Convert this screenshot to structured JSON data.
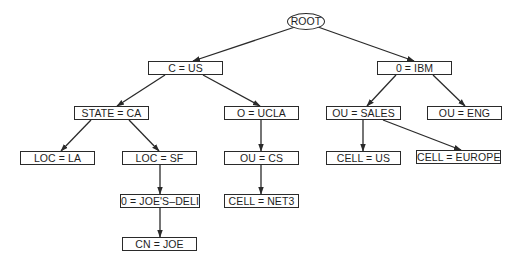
{
  "diagram": {
    "type": "directory-information-tree",
    "colors": {
      "line": "#2a2a2a",
      "text": "#1e1e1e",
      "background": "#ffffff"
    },
    "nodes": [
      {
        "id": "root",
        "label": "ROOT",
        "shape": "ellipse",
        "x": 287,
        "y": 13,
        "w": 38,
        "h": 17
      },
      {
        "id": "c_us",
        "label": "C = US",
        "shape": "rect",
        "x": 148,
        "y": 61,
        "w": 75,
        "h": 14
      },
      {
        "id": "o_ibm",
        "label": "0 = IBM",
        "shape": "rect",
        "x": 377,
        "y": 61,
        "w": 75,
        "h": 14
      },
      {
        "id": "state_ca",
        "label": "STATE = CA",
        "shape": "rect",
        "x": 74,
        "y": 106,
        "w": 75,
        "h": 14
      },
      {
        "id": "o_ucla",
        "label": "O = UCLA",
        "shape": "rect",
        "x": 224,
        "y": 106,
        "w": 75,
        "h": 14
      },
      {
        "id": "ou_sales",
        "label": "OU = SALES",
        "shape": "rect",
        "x": 326,
        "y": 106,
        "w": 75,
        "h": 14
      },
      {
        "id": "ou_eng",
        "label": "OU = ENG",
        "shape": "rect",
        "x": 427,
        "y": 106,
        "w": 75,
        "h": 14
      },
      {
        "id": "loc_la",
        "label": "LOC = LA",
        "shape": "rect",
        "x": 20,
        "y": 151,
        "w": 75,
        "h": 14
      },
      {
        "id": "loc_sf",
        "label": "LOC = SF",
        "shape": "rect",
        "x": 122,
        "y": 151,
        "w": 75,
        "h": 14
      },
      {
        "id": "ou_cs",
        "label": "OU = CS",
        "shape": "rect",
        "x": 224,
        "y": 151,
        "w": 75,
        "h": 14
      },
      {
        "id": "cell_us",
        "label": "CELL = US",
        "shape": "rect",
        "x": 326,
        "y": 151,
        "w": 75,
        "h": 14
      },
      {
        "id": "cell_eu",
        "label": "CELL = EUROPE",
        "shape": "rect",
        "x": 416,
        "y": 150,
        "w": 85,
        "h": 14
      },
      {
        "id": "o_joes",
        "label": "0 = JOE'S–DELI",
        "shape": "rect",
        "x": 120,
        "y": 194,
        "w": 80,
        "h": 14
      },
      {
        "id": "cell_net3",
        "label": "CELL = NET3",
        "shape": "rect",
        "x": 224,
        "y": 194,
        "w": 75,
        "h": 14
      },
      {
        "id": "cn_joe",
        "label": "CN = JOE",
        "shape": "rect",
        "x": 122,
        "y": 237,
        "w": 75,
        "h": 14
      }
    ],
    "edges": [
      {
        "from": "root",
        "to": "c_us",
        "x1": 295,
        "y1": 27,
        "x2": 193,
        "y2": 61
      },
      {
        "from": "root",
        "to": "o_ibm",
        "x1": 318,
        "y1": 27,
        "x2": 414,
        "y2": 61
      },
      {
        "from": "c_us",
        "to": "state_ca",
        "x1": 165,
        "y1": 75,
        "x2": 117,
        "y2": 106
      },
      {
        "from": "c_us",
        "to": "o_ucla",
        "x1": 203,
        "y1": 75,
        "x2": 260,
        "y2": 106
      },
      {
        "from": "o_ibm",
        "to": "ou_sales",
        "x1": 396,
        "y1": 75,
        "x2": 367,
        "y2": 106
      },
      {
        "from": "o_ibm",
        "to": "ou_eng",
        "x1": 433,
        "y1": 75,
        "x2": 465,
        "y2": 106
      },
      {
        "from": "state_ca",
        "to": "loc_la",
        "x1": 91,
        "y1": 120,
        "x2": 61,
        "y2": 151
      },
      {
        "from": "state_ca",
        "to": "loc_sf",
        "x1": 129,
        "y1": 120,
        "x2": 159,
        "y2": 151
      },
      {
        "from": "o_ucla",
        "to": "ou_cs",
        "x1": 261,
        "y1": 120,
        "x2": 261,
        "y2": 151
      },
      {
        "from": "ou_sales",
        "to": "cell_us",
        "x1": 363,
        "y1": 120,
        "x2": 363,
        "y2": 151
      },
      {
        "from": "ou_sales",
        "to": "cell_eu",
        "x1": 383,
        "y1": 120,
        "x2": 461,
        "y2": 150
      },
      {
        "from": "loc_sf",
        "to": "o_joes",
        "x1": 160,
        "y1": 165,
        "x2": 160,
        "y2": 194
      },
      {
        "from": "ou_cs",
        "to": "cell_net3",
        "x1": 261,
        "y1": 165,
        "x2": 261,
        "y2": 194
      },
      {
        "from": "o_joes",
        "to": "cn_joe",
        "x1": 160,
        "y1": 208,
        "x2": 160,
        "y2": 237
      }
    ]
  }
}
